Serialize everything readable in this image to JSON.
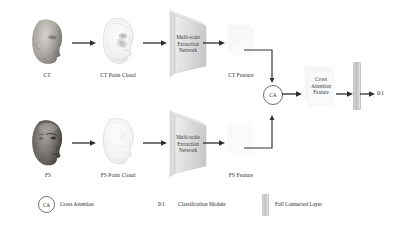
{
  "figure": {
    "type": "architecture-diagram",
    "background": "#ffffff",
    "line_color": "#333333",
    "text_color": "#2b2b2b"
  },
  "pipelines": [
    {
      "id": "ct",
      "input_label": "CT",
      "point_cloud_label": "CT Point Cloud",
      "network_label": "Multi-scale\nExtraction\nNetwork",
      "feature_label": "CT Feature"
    },
    {
      "id": "fs",
      "input_label": "FS",
      "point_cloud_label": "FS Point Cloud",
      "network_label": "Multi-scale\nExtraction\nNetwork",
      "feature_label": "FS Feature"
    }
  ],
  "labels": {
    "ct_input": "CT",
    "ct_point_cloud": "CT Point Cloud",
    "ct_feature": "CT Feature",
    "fs_input": "FS",
    "fs_point_cloud": "FS Point Cloud",
    "fs_feature": "FS Feature",
    "net_line1": "Multi-scale",
    "net_line2": "Extraction",
    "net_line3": "Network",
    "ca_node": "CA",
    "ca_feature_line1": "Cross",
    "ca_feature_line2": "Attention",
    "ca_feature_line3": "Feature",
    "output": "0/1"
  },
  "legend": {
    "items": [
      {
        "symbol": "CA",
        "text": "Cross Attention",
        "glyph": "circle-ca"
      },
      {
        "symbol": "0/1",
        "text": "Classification Module",
        "glyph": "text-01"
      },
      {
        "symbol": "",
        "text": "Full Connected Layer",
        "glyph": "fc-bar"
      }
    ],
    "ca_symbol": "CA",
    "ca_text": "Cross Attention",
    "cls_symbol": "0/1",
    "cls_text": "Classification Module",
    "fc_text": "Full Connected Layer"
  },
  "colors": {
    "arrow": "#2d2d2d",
    "net_fill_light": "#e9e9e9",
    "net_fill_dark": "#cfcfcf",
    "feature_fill": "#f0f0f2",
    "fc_bar": "#c8c8c8",
    "ca_border": "#6d6d6d"
  }
}
